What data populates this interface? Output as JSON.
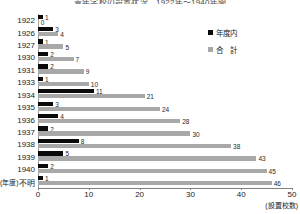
{
  "chart_title": "青年学校の設置状況　1922年〜1940年間",
  "legend": {
    "position": "top-right",
    "entries": [
      {
        "label": "年度内",
        "color": "#0a0a0a",
        "key": "inner"
      },
      {
        "label": "合　計",
        "color": "#a8a8a8",
        "key": "total"
      }
    ]
  },
  "axis": {
    "x_ticks": [
      "0",
      "10",
      "20",
      "30",
      "40",
      "50"
    ],
    "x_unit_label": "(設置校数)",
    "y_unit_label": "(年度)"
  },
  "chart_data": {
    "type": "bar",
    "orientation": "horizontal",
    "title": "青年学校の設置状況　1922年〜1940年間",
    "xlabel": "(設置校数)",
    "ylabel": "(年度)",
    "xlim": [
      0,
      50
    ],
    "grid": false,
    "legend_position": "top-right",
    "categories": [
      "1922",
      "1926",
      "1927",
      "1930",
      "1931",
      "1933",
      "1934",
      "1935",
      "1936",
      "1937",
      "1938",
      "1939",
      "1940",
      "不明"
    ],
    "series": [
      {
        "name": "年度内",
        "color": "#0a0a0a",
        "values": [
          1,
          3,
          1,
          2,
          2,
          1,
          11,
          3,
          4,
          2,
          8,
          5,
          2,
          1
        ]
      },
      {
        "name": "合　計",
        "color": "#a8a8a8",
        "values": [
          0,
          4,
          5,
          7,
          9,
          10,
          21,
          24,
          28,
          30,
          38,
          43,
          45,
          46
        ]
      }
    ]
  }
}
